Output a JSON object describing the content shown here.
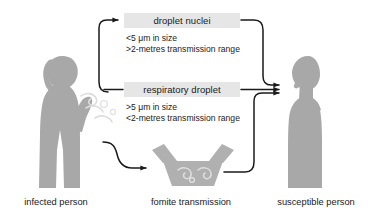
{
  "diagram": {
    "colors": {
      "silhouette": "#a8a8a8",
      "silhouette_light": "#d9d9d9",
      "box_background": "#e6e6e6",
      "arrow": "#1a1a1a",
      "text": "#1a1a1a",
      "page_background": "#ffffff"
    },
    "boxes": [
      {
        "id": "droplet-nuclei",
        "label": "droplet nuclei",
        "specs": [
          "<5 μm in size",
          ">2-metres transmission range"
        ]
      },
      {
        "id": "respiratory-droplet",
        "label": "respiratory droplet",
        "specs": [
          ">5 μm in size",
          "<2-metres transmission range"
        ]
      }
    ],
    "figures": [
      {
        "id": "infected-person",
        "caption": "infected person",
        "icon": "coughing-person-silhouette-icon"
      },
      {
        "id": "fomite-transmission",
        "caption": "fomite transmission",
        "icon": "contaminated-surface-icon"
      },
      {
        "id": "susceptible-person",
        "caption": "susceptible person",
        "icon": "standing-person-silhouette-icon"
      }
    ],
    "arrows": [
      {
        "id": "infected-to-droplet-nuclei",
        "from": "infected-person",
        "to": "droplet-nuclei",
        "icon": "curved-arrow-up-icon"
      },
      {
        "id": "infected-to-respiratory-droplet",
        "from": "infected-person",
        "to": "respiratory-droplet",
        "icon": "arrow-right-icon"
      },
      {
        "id": "infected-to-fomite",
        "from": "infected-person",
        "to": "fomite-transmission",
        "icon": "curved-arrow-down-icon"
      },
      {
        "id": "droplet-nuclei-to-susceptible",
        "from": "droplet-nuclei",
        "to": "susceptible-person",
        "icon": "curved-arrow-down-right-icon"
      },
      {
        "id": "respiratory-droplet-to-susceptible",
        "from": "respiratory-droplet",
        "to": "susceptible-person",
        "icon": "arrow-right-icon"
      },
      {
        "id": "fomite-to-susceptible",
        "from": "fomite-transmission",
        "to": "susceptible-person",
        "icon": "curved-arrow-up-right-icon"
      }
    ]
  }
}
